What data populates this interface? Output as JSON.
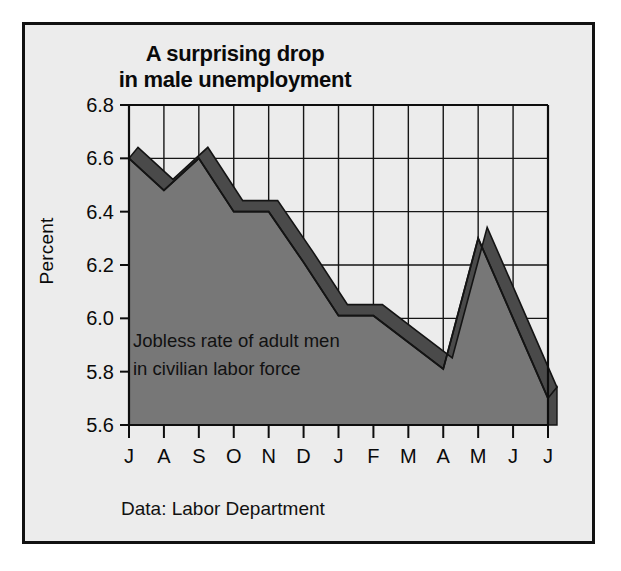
{
  "figure": {
    "title_line1": "A surprising drop",
    "title_line2": "in male unemployment",
    "ylabel": "Percent",
    "annotation_line1": "Jobless rate of adult men",
    "annotation_line2": "in civilian labor force",
    "source_note": "Data: Labor Department",
    "colors": {
      "panel_background": "#ececec",
      "panel_border": "#111111",
      "area_fill": "#777777",
      "ribbon_edge": "#4a4a4a",
      "line_stroke": "#141414",
      "grid": "#161616",
      "text": "#0a0a0a"
    }
  },
  "chart_data": {
    "type": "area",
    "title": "A surprising drop in male unemployment",
    "subtitle": "Jobless rate of adult men in civilian labor force",
    "source": "Data: Labor Department",
    "xlabel": "",
    "ylabel": "Percent",
    "categories": [
      "J",
      "A",
      "S",
      "O",
      "N",
      "D",
      "J",
      "F",
      "M",
      "A",
      "M",
      "J",
      "J"
    ],
    "values": [
      6.6,
      6.48,
      6.6,
      6.4,
      6.4,
      6.21,
      6.01,
      6.01,
      5.91,
      5.81,
      6.3,
      6.0,
      5.7
    ],
    "ylim": [
      5.6,
      6.8
    ],
    "yticks": [
      "5.6",
      "5.8",
      "6.0",
      "6.2",
      "6.4",
      "6.6",
      "6.8"
    ],
    "ytick_values": [
      5.6,
      5.8,
      6.0,
      6.2,
      6.4,
      6.6,
      6.8
    ],
    "grid": true,
    "legend": "none",
    "style": "3d-ribbon-area"
  }
}
